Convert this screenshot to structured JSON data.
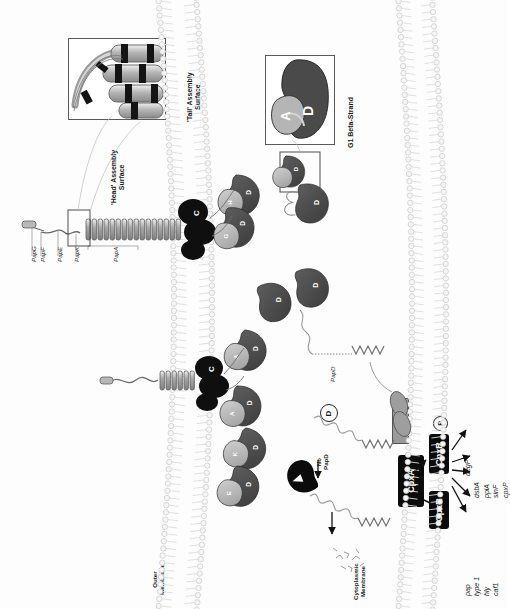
{
  "figure": {
    "orientation": "rotated-90-ccw"
  },
  "insets": {
    "rod": {
      "name": "pilus-rod-inset",
      "caption_head": "'Head' Assembly\nSurface",
      "caption_head_line1": "'Head' Assembly",
      "caption_head_line2": "Surface",
      "caption_tail_line1": "'Tail' Assembly",
      "caption_tail_line2": "Surface"
    },
    "g1": {
      "name": "g1-beta-strand-inset",
      "caption": "G1 Beta-Strand",
      "subunit_label": "A",
      "chaperone_label": "D"
    }
  },
  "pilus_labels": [
    {
      "id": "papg",
      "text": "PapG"
    },
    {
      "id": "papf",
      "text": "PapF"
    },
    {
      "id": "pape",
      "text": "PapE"
    },
    {
      "id": "papk",
      "text": "PapK"
    },
    {
      "id": "papa",
      "text": "PapA"
    }
  ],
  "membranes": {
    "outer_line1": "Outer",
    "outer_line2": "Membrane",
    "cytoplasmic_line1": "Cytoplasmic",
    "cytoplasmic_line2": "Membrane"
  },
  "periplasm": {
    "papd_label": "PapD",
    "no_papd_line1": "No",
    "no_papd_line2": "PapD",
    "degp_circle": "D",
    "chaperone_glyph": "D",
    "subunit_glyphs": [
      "A",
      "K",
      "E",
      "F",
      "G",
      "H"
    ]
  },
  "cpx": {
    "sensor_label": "CpxA",
    "regulator_label": "CpxR",
    "regulator_phos_label": "CpxR",
    "phospho_label": "P",
    "cooh_label": "COOH"
  },
  "genes": {
    "activated_group": [
      "degP",
      "dsbA",
      "ppiA",
      "sinF",
      "cpxP"
    ],
    "repressed_group": [
      "pap",
      "type 1",
      "hly",
      "caf1"
    ],
    "degp": "degP",
    "dsba": "dsbA",
    "ppia": "ppiA",
    "sinf": "sinF",
    "cpxp": "cpxP",
    "pap": "pap",
    "type1": "type 1",
    "hly": "hly",
    "caf1": "caf1"
  },
  "colors": {
    "subunit_dark": "#4f4f4f",
    "chaperone_light": "#b9b9b9",
    "usher_black": "#111111",
    "membrane_gray": "#e9e9e9",
    "box_black": "#0b0b0b",
    "cooh_gray": "#9a9a9a"
  }
}
